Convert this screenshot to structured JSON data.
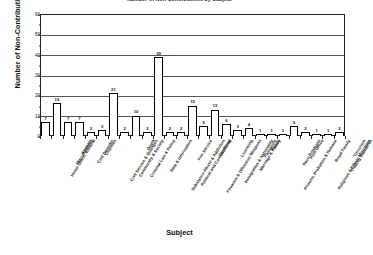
{
  "chart_data": {
    "type": "bar",
    "title": "Number of Non-Contributions by Subject",
    "xlabel": "Subject",
    "ylabel": "Number of Non-Contributions",
    "ylim": [
      0,
      60
    ],
    "ytick_values": [
      0,
      10,
      20,
      30,
      40,
      50,
      60
    ],
    "ytick_labels": [
      "0",
      "10",
      "20",
      "30",
      "40",
      "50",
      "60"
    ],
    "minor_tick_step": 5,
    "grid": "horizontal",
    "legend": "none",
    "categories": [
      "Home Office: General",
      "Miscellaneous",
      "Animals",
      "Civil Disorder",
      "Charities",
      "Civil Service & Quangos",
      "Community & Society",
      "Criminal Law & Policy",
      "Death",
      "Data & Information",
      "Substance Abuse & Addiction",
      "Political and Constitutional",
      "Fire Service",
      "Firearms & Offensive Weapons",
      "Gambling",
      "Immigration & Nationality",
      "Licensing",
      "Marriage & Family",
      "Passports",
      "Police",
      "Prisons, Probation & Release",
      "Race Relations",
      "Post Office",
      "Religious & Ethnic Minorities",
      "Royal Family",
      "Trading Standards",
      "Terrorism"
    ],
    "values": [
      7,
      16,
      7,
      7,
      2,
      3,
      21,
      2,
      10,
      2,
      39,
      2,
      2,
      15,
      5,
      13,
      6,
      3,
      4,
      1,
      1,
      1,
      5,
      2,
      1,
      1,
      2
    ],
    "bar_style": {
      "fill": "#ffffff",
      "edge": "#000000",
      "value_labels": true
    }
  }
}
